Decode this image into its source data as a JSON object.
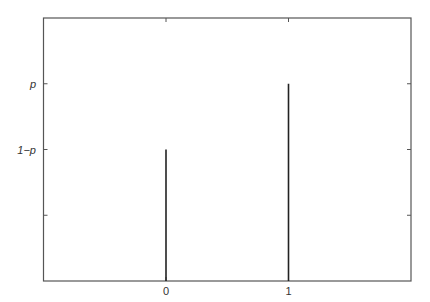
{
  "chart_data": {
    "type": "bar",
    "subtype": "stem",
    "title": "",
    "xlabel": "",
    "ylabel": "",
    "categories": [
      "0",
      "1"
    ],
    "x": [
      0,
      1
    ],
    "values": [
      0.4,
      0.6
    ],
    "value_labels": [
      "1−p",
      "p"
    ],
    "xlim": [
      -1,
      2
    ],
    "ylim": [
      0,
      0.8
    ],
    "xticks": [
      {
        "value": 0,
        "label": "0"
      },
      {
        "value": 1,
        "label": "1"
      }
    ],
    "yticks": [
      {
        "value": 0.2,
        "label": ""
      },
      {
        "value": 0.4,
        "label": "1−p"
      },
      {
        "value": 0.6,
        "label": "p"
      }
    ],
    "grid": false,
    "legend": null,
    "colors": {
      "frame": "#555555",
      "stem": "#222222",
      "text": "#333333"
    }
  }
}
